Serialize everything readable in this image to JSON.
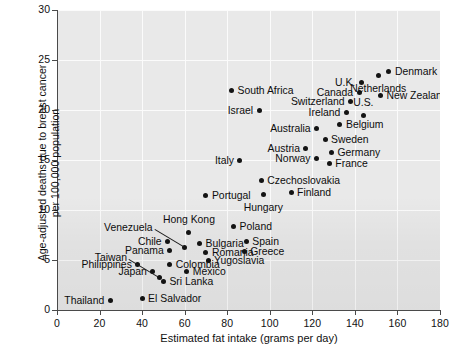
{
  "chart_data": {
    "type": "scatter",
    "title": "",
    "xlabel": "Estimated fat intake (grams per day)",
    "ylabel": "Age-adjusted deaths due to breast cancer per 100,000 population",
    "ylabel_line1": "Age-adjusted deaths due to breast cancer",
    "ylabel_line2": "per 100,000 population",
    "xlim": [
      0,
      180
    ],
    "ylim": [
      0,
      30
    ],
    "xticks": [
      0,
      20,
      40,
      60,
      80,
      100,
      120,
      140,
      160,
      180
    ],
    "yticks": [
      0,
      5,
      10,
      15,
      20,
      25,
      30
    ],
    "grid": true,
    "legend": "none",
    "marker_color": "#141414",
    "panel_color": "#e9e9e9",
    "grid_color": "#fbfbfb",
    "axis_color": "#4a4a4a",
    "points": [
      {
        "label": "Thailand",
        "x": 25,
        "y": 1.0,
        "pos": "left"
      },
      {
        "label": "El Salvador",
        "x": 40,
        "y": 1.2,
        "pos": "right"
      },
      {
        "label": "Philippines",
        "x": 38,
        "y": 4.6,
        "pos": "left"
      },
      {
        "label": "Japan",
        "x": 45,
        "y": 3.9,
        "pos": "left"
      },
      {
        "label": "Taiwan",
        "x": 48,
        "y": 3.3,
        "pos": "leader"
      },
      {
        "label": "Sri Lanka",
        "x": 50,
        "y": 2.9,
        "pos": "right"
      },
      {
        "label": "Colombia",
        "x": 53,
        "y": 4.6,
        "pos": "right"
      },
      {
        "label": "Mexico",
        "x": 61,
        "y": 3.9,
        "pos": "right"
      },
      {
        "label": "Panama",
        "x": 53,
        "y": 6.0,
        "pos": "left"
      },
      {
        "label": "Chile",
        "x": 52,
        "y": 6.9,
        "pos": "left"
      },
      {
        "label": "Venezuela",
        "x": 60,
        "y": 6.3,
        "pos": "leader"
      },
      {
        "label": "Hong Kong",
        "x": 62,
        "y": 7.8,
        "pos": "above"
      },
      {
        "label": "Bulgaria",
        "x": 67,
        "y": 6.7,
        "pos": "right"
      },
      {
        "label": "Romania",
        "x": 70,
        "y": 5.8,
        "pos": "right"
      },
      {
        "label": "Yugoslavia",
        "x": 71,
        "y": 5.0,
        "pos": "right"
      },
      {
        "label": "Portugal",
        "x": 70,
        "y": 11.5,
        "pos": "right"
      },
      {
        "label": "Poland",
        "x": 83,
        "y": 8.4,
        "pos": "right"
      },
      {
        "label": "Italy",
        "x": 86,
        "y": 15.0,
        "pos": "left"
      },
      {
        "label": "Spain",
        "x": 89,
        "y": 6.9,
        "pos": "right"
      },
      {
        "label": "Greece",
        "x": 88,
        "y": 5.9,
        "pos": "right"
      },
      {
        "label": "Hungary",
        "x": 97,
        "y": 11.6,
        "pos": "below"
      },
      {
        "label": "Czechoslovakia",
        "x": 96,
        "y": 13.0,
        "pos": "right"
      },
      {
        "label": "South Africa",
        "x": 82,
        "y": 22.0,
        "pos": "right"
      },
      {
        "label": "Israel",
        "x": 95,
        "y": 20.0,
        "pos": "left"
      },
      {
        "label": "Finland",
        "x": 110,
        "y": 11.8,
        "pos": "right"
      },
      {
        "label": "Austria",
        "x": 117,
        "y": 16.2,
        "pos": "left"
      },
      {
        "label": "Norway",
        "x": 122,
        "y": 15.2,
        "pos": "left"
      },
      {
        "label": "Australia",
        "x": 122,
        "y": 18.2,
        "pos": "left"
      },
      {
        "label": "France",
        "x": 128,
        "y": 14.7,
        "pos": "right"
      },
      {
        "label": "Germany",
        "x": 129,
        "y": 15.8,
        "pos": "right"
      },
      {
        "label": "Sweden",
        "x": 126,
        "y": 17.1,
        "pos": "right"
      },
      {
        "label": "Belgium",
        "x": 133,
        "y": 18.6,
        "pos": "right"
      },
      {
        "label": "Ireland",
        "x": 136,
        "y": 19.8,
        "pos": "left"
      },
      {
        "label": "Switzerland",
        "x": 138,
        "y": 20.9,
        "pos": "left"
      },
      {
        "label": "Canada",
        "x": 142,
        "y": 21.8,
        "pos": "left"
      },
      {
        "label": "U.K.",
        "x": 143,
        "y": 22.8,
        "pos": "left"
      },
      {
        "label": "U.S.",
        "x": 144,
        "y": 19.5,
        "pos": "above"
      },
      {
        "label": "Netherlands",
        "x": 151,
        "y": 23.5,
        "pos": "below"
      },
      {
        "label": "New Zealand",
        "x": 152,
        "y": 21.5,
        "pos": "right"
      },
      {
        "label": "Denmark",
        "x": 156,
        "y": 23.9,
        "pos": "right"
      }
    ]
  }
}
